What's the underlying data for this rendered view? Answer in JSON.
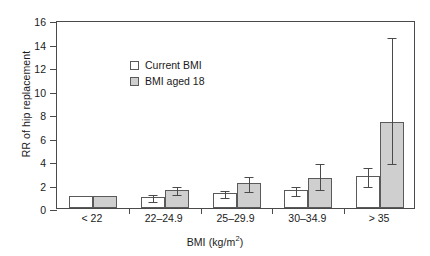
{
  "chart_data": {
    "type": "bar",
    "title": "",
    "xlabel": "BMI (kg/m2)",
    "xlabel_base": "BMI (kg/m",
    "xlabel_sup": "2",
    "xlabel_close": ")",
    "ylabel": "RR of hip replacement",
    "ylim": [
      0,
      16
    ],
    "ytick_step": 2,
    "yticks": [
      "0",
      "2",
      "4",
      "6",
      "8",
      "10",
      "12",
      "14",
      "16"
    ],
    "grid": false,
    "legend_position": "top-left",
    "categories": [
      "< 22",
      "22–24.9",
      "25–29.9",
      "30–34.9",
      "> 35"
    ],
    "series": [
      {
        "name": "Current BMI",
        "color": "#ffffff",
        "values": [
          1.0,
          0.9,
          1.25,
          1.55,
          2.7
        ],
        "ci_low": [
          null,
          0.72,
          1.0,
          1.2,
          1.95
        ],
        "ci_high": [
          null,
          1.25,
          1.62,
          2.0,
          3.55
        ]
      },
      {
        "name": "BMI aged 18",
        "color": "#cfcfcf",
        "values": [
          1.0,
          1.55,
          2.1,
          2.55,
          7.3
        ],
        "ci_low": [
          null,
          1.25,
          1.5,
          1.7,
          3.9
        ],
        "ci_high": [
          null,
          1.95,
          2.85,
          3.9,
          14.6
        ]
      }
    ]
  },
  "legend": {
    "items": [
      {
        "label": "Current BMI"
      },
      {
        "label": "BMI aged 18"
      }
    ]
  }
}
